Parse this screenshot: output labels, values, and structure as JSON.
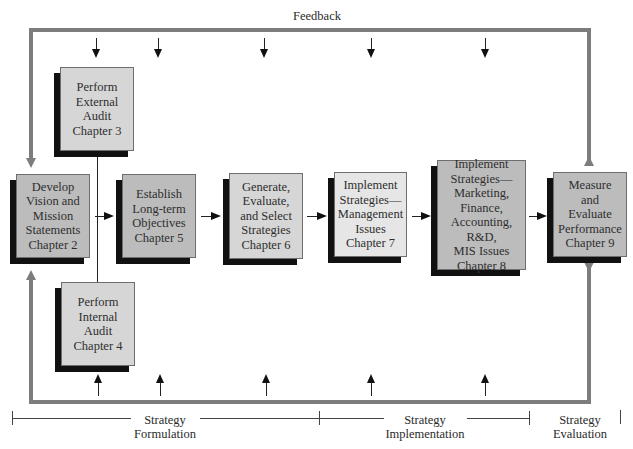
{
  "diagram": {
    "feedback_label": "Feedback",
    "colors": {
      "loop_line": "#7d7d7d",
      "box_light": "#d6d6d6",
      "box_mid": "#bcbcbc",
      "box_pale": "#e6e6e6",
      "shadow": "#111111"
    },
    "boxes": {
      "external_audit": "Perform\nExternal\nAudit\nChapter 3",
      "internal_audit": "Perform\nInternal\nAudit\nChapter 4",
      "develop_vision": "Develop\nVision and\nMission\nStatements\nChapter 2",
      "establish_objectives": "Establish\nLong-term\nObjectives\nChapter 5",
      "generate_strategies": "Generate,\nEvaluate,\nand Select\nStrategies\nChapter 6",
      "implement_management": "Implement\nStrategies—\nManagement\nIssues\nChapter 7",
      "implement_functional": "Implement\nStrategies—\nMarketing,\nFinance,\nAccounting, R&D,\nMIS Issues\nChapter 8",
      "measure_evaluate": "Measure\nand\nEvaluate\nPerformance\nChapter 9"
    },
    "timeline": {
      "formulation": "Strategy\nFormulation",
      "implementation": "Strategy\nImplementation",
      "evaluation": "Strategy\nEvaluation"
    }
  }
}
